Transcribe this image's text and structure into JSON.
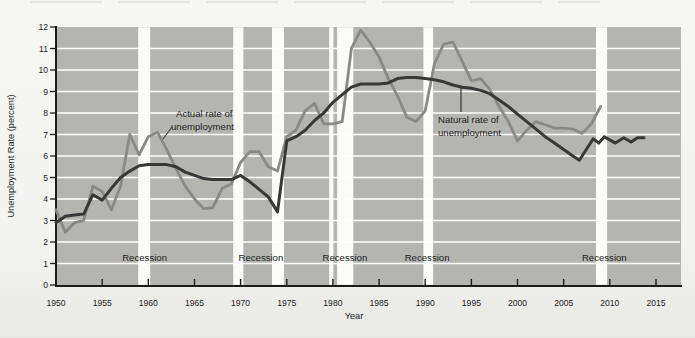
{
  "chart_data": {
    "type": "line",
    "title": "",
    "xlabel": "Year",
    "ylabel": "Unemployment Rate (percent)",
    "xlim": [
      1950,
      2017.8
    ],
    "ylim": [
      0,
      12
    ],
    "x_ticks": [
      1950,
      1955,
      1960,
      1965,
      1970,
      1975,
      1980,
      1985,
      1990,
      1995,
      2000,
      2005,
      2010,
      2015
    ],
    "y_ticks": [
      0,
      1,
      2,
      3,
      4,
      5,
      6,
      7,
      8,
      9,
      10,
      11,
      12
    ],
    "grid": "horizontal white gridlines on gray plot area",
    "legend_position": "inline-annotations",
    "colors": {
      "plot_bg": "#b4b5b1",
      "gridline": "#ffffff",
      "band": "#fbfbf9",
      "axis": "#1c1c1c",
      "actual_line": "#898a88",
      "natural_line": "#383838"
    },
    "series": [
      {
        "name": "Actual rate of unemployment",
        "color": "#898a88",
        "width": 2.8,
        "points": [
          [
            1950,
            3.5
          ],
          [
            1951,
            2.45
          ],
          [
            1952,
            2.9
          ],
          [
            1953,
            3.0
          ],
          [
            1954,
            4.6
          ],
          [
            1955,
            4.35
          ],
          [
            1956,
            3.5
          ],
          [
            1957,
            4.6
          ],
          [
            1958,
            7.0
          ],
          [
            1959,
            6.05
          ],
          [
            1960,
            6.9
          ],
          [
            1961,
            7.1
          ],
          [
            1962,
            6.3
          ],
          [
            1963,
            5.4
          ],
          [
            1964,
            4.6
          ],
          [
            1965,
            4.0
          ],
          [
            1966,
            3.55
          ],
          [
            1967,
            3.6
          ],
          [
            1968,
            4.5
          ],
          [
            1969,
            4.7
          ],
          [
            1970,
            5.7
          ],
          [
            1971,
            6.2
          ],
          [
            1972,
            6.2
          ],
          [
            1973,
            5.5
          ],
          [
            1974,
            5.3
          ],
          [
            1975,
            6.9
          ],
          [
            1976,
            7.2
          ],
          [
            1977,
            8.1
          ],
          [
            1978,
            8.45
          ],
          [
            1979,
            7.5
          ],
          [
            1980,
            7.5
          ],
          [
            1981,
            7.6
          ],
          [
            1982,
            11.0
          ],
          [
            1983,
            11.85
          ],
          [
            1984,
            11.3
          ],
          [
            1985,
            10.6
          ],
          [
            1986,
            9.6
          ],
          [
            1987,
            8.8
          ],
          [
            1988,
            7.8
          ],
          [
            1989,
            7.6
          ],
          [
            1990,
            8.1
          ],
          [
            1991,
            10.3
          ],
          [
            1992,
            11.2
          ],
          [
            1993,
            11.3
          ],
          [
            1994,
            10.4
          ],
          [
            1995,
            9.5
          ],
          [
            1996,
            9.6
          ],
          [
            1997,
            9.1
          ],
          [
            1998,
            8.3
          ],
          [
            1999,
            7.6
          ],
          [
            2000,
            6.7
          ],
          [
            2001,
            7.2
          ],
          [
            2002,
            7.6
          ],
          [
            2003,
            7.45
          ],
          [
            2004,
            7.3
          ],
          [
            2005,
            7.3
          ],
          [
            2006,
            7.25
          ],
          [
            2007,
            7.05
          ],
          [
            2008,
            7.5
          ],
          [
            2009,
            8.3
          ]
        ]
      },
      {
        "name": "Natural rate of unemployment",
        "color": "#383838",
        "width": 3,
        "points": [
          [
            1950,
            2.9
          ],
          [
            1951,
            3.2
          ],
          [
            1952,
            3.25
          ],
          [
            1953,
            3.3
          ],
          [
            1954,
            4.2
          ],
          [
            1955,
            3.95
          ],
          [
            1956,
            4.5
          ],
          [
            1957,
            5.0
          ],
          [
            1958,
            5.3
          ],
          [
            1959,
            5.55
          ],
          [
            1960,
            5.6
          ],
          [
            1961,
            5.6
          ],
          [
            1962,
            5.6
          ],
          [
            1963,
            5.5
          ],
          [
            1964,
            5.25
          ],
          [
            1965,
            5.1
          ],
          [
            1966,
            4.95
          ],
          [
            1967,
            4.9
          ],
          [
            1968,
            4.9
          ],
          [
            1969,
            4.9
          ],
          [
            1970,
            5.1
          ],
          [
            1971,
            4.8
          ],
          [
            1972,
            4.45
          ],
          [
            1973,
            4.1
          ],
          [
            1974,
            3.4
          ],
          [
            1975,
            6.7
          ],
          [
            1976,
            6.9
          ],
          [
            1977,
            7.2
          ],
          [
            1978,
            7.65
          ],
          [
            1979,
            8.0
          ],
          [
            1980,
            8.5
          ],
          [
            1981,
            8.85
          ],
          [
            1982,
            9.2
          ],
          [
            1983,
            9.35
          ],
          [
            1984,
            9.35
          ],
          [
            1985,
            9.35
          ],
          [
            1986,
            9.4
          ],
          [
            1987,
            9.6
          ],
          [
            1988,
            9.65
          ],
          [
            1989,
            9.65
          ],
          [
            1990,
            9.6
          ],
          [
            1991,
            9.55
          ],
          [
            1992,
            9.45
          ],
          [
            1993,
            9.3
          ],
          [
            1994,
            9.2
          ],
          [
            1995,
            9.15
          ],
          [
            1996,
            9.05
          ],
          [
            1997,
            8.9
          ],
          [
            1998,
            8.6
          ],
          [
            1999,
            8.3
          ],
          [
            2000,
            7.95
          ],
          [
            2001,
            7.6
          ],
          [
            2002,
            7.25
          ],
          [
            2003,
            6.9
          ],
          [
            2004,
            6.6
          ],
          [
            2005,
            6.3
          ],
          [
            2006,
            6.0
          ],
          [
            2006.7,
            5.8
          ],
          [
            2008.2,
            6.8
          ],
          [
            2008.8,
            6.6
          ],
          [
            2009.4,
            6.9
          ],
          [
            2010.6,
            6.6
          ],
          [
            2011.5,
            6.85
          ],
          [
            2012.3,
            6.65
          ],
          [
            2013,
            6.85
          ],
          [
            2013.7,
            6.85
          ]
        ]
      }
    ],
    "recession_bands": [
      [
        1958.9,
        1960.2
      ],
      [
        1969.2,
        1970.3
      ],
      [
        1973.4,
        1974.7
      ],
      [
        1979.6,
        1980.05
      ],
      [
        1980.45,
        1982.2
      ],
      [
        1989.8,
        1990.85
      ],
      [
        2008.5,
        2009.7
      ]
    ],
    "recession_labels": {
      "text": "Recession",
      "centers_year": [
        1959.6,
        1972.2,
        1981.3,
        1990.2,
        2009.4
      ],
      "y_value": 1.26
    },
    "annotations": [
      {
        "id": "actual-rate",
        "lines": [
          "Actual rate of",
          "unemployment"
        ]
      },
      {
        "id": "natural-rate",
        "lines": [
          "Natural rate of",
          "unemployment"
        ]
      }
    ]
  }
}
